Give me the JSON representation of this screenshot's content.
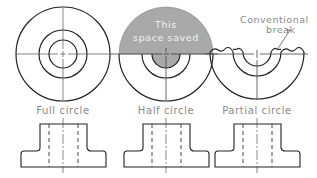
{
  "figure": {
    "views": [
      {
        "id": "full",
        "label": "Full circle"
      },
      {
        "id": "half",
        "label": "Half circle",
        "annotation_line1": "This",
        "annotation_line2": "space saved"
      },
      {
        "id": "partial",
        "label": "Partial circle",
        "annotation_line1": "Conventional",
        "annotation_line2": "break"
      }
    ],
    "colors": {
      "line": "#222222",
      "centerline": "#555555",
      "shade": "#a9a9a9",
      "label": "#8a8a8a"
    }
  }
}
